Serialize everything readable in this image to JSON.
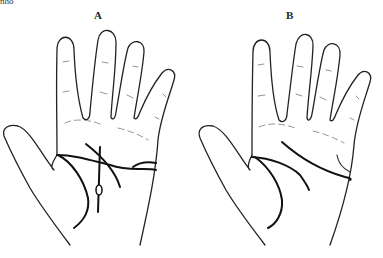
{
  "caption_fragment": "nho",
  "figures": [
    {
      "label": "A",
      "description": "Hand palm with crossing palm lines and island"
    },
    {
      "label": "B",
      "description": "Hand palm with standard palm lines"
    }
  ]
}
